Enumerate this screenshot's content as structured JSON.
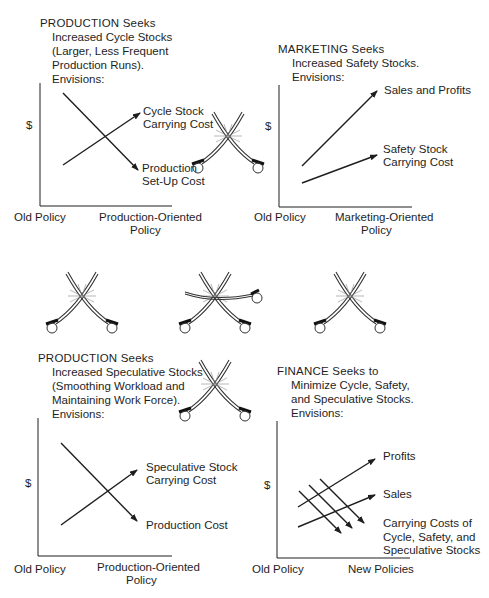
{
  "panels": {
    "production_cycle": {
      "heading": "PRODUCTION Seeks",
      "lines": [
        "Increased Cycle Stocks",
        "(Larger, Less Frequent",
        "Production Runs).",
        "Envisions:"
      ],
      "y_label": "$",
      "x_left": "Old Policy",
      "x_right_1": "Production-Oriented",
      "x_right_2": "Policy",
      "series": [
        {
          "name": "Cycle Stock Carrying Cost",
          "label_1": "Cycle Stock",
          "label_2": "Carrying Cost",
          "trend": "increasing"
        },
        {
          "name": "Production Set-Up Cost",
          "label_1": "Production",
          "label_2": "Set-Up Cost",
          "trend": "decreasing"
        }
      ]
    },
    "marketing": {
      "heading": "MARKETING Seeks",
      "lines": [
        "Increased Safety Stocks.",
        "Envisions:"
      ],
      "y_label": "$",
      "x_left": "Old Policy",
      "x_right_1": "Marketing-Oriented",
      "x_right_2": "Policy",
      "series": [
        {
          "name": "Sales and Profits",
          "label_1": "Sales and Profits",
          "label_2": "",
          "trend": "increasing-steep"
        },
        {
          "name": "Safety Stock Carrying Cost",
          "label_1": "Safety Stock",
          "label_2": "Carrying Cost",
          "trend": "increasing"
        }
      ]
    },
    "production_speculative": {
      "heading": "PRODUCTION Seeks",
      "lines": [
        "Increased Speculative Stocks",
        "(Smoothing Workload and",
        "Maintaining Work Force).",
        "Envisions:"
      ],
      "y_label": "$",
      "x_left": "Old Policy",
      "x_right_1": "Production-Oriented",
      "x_right_2": "Policy",
      "series": [
        {
          "name": "Speculative Stock Carrying Cost",
          "label_1": "Speculative  Stock",
          "label_2": "Carrying Cost",
          "trend": "increasing"
        },
        {
          "name": "Production Cost",
          "label_1": "Production Cost",
          "label_2": "",
          "trend": "decreasing"
        }
      ]
    },
    "finance": {
      "heading": "FINANCE Seeks to",
      "lines": [
        "Minimize Cycle, Safety,",
        "and Speculative Stocks.",
        "Envisions:"
      ],
      "y_label": "$",
      "x_left": "Old Policy",
      "x_right_1": "New Policies",
      "series": [
        {
          "name": "Profits",
          "label_1": "Profits",
          "trend": "increasing"
        },
        {
          "name": "Sales",
          "label_1": "Sales",
          "trend": "increasing"
        },
        {
          "name": "Carrying Costs of Cycle, Safety, and Speculative Stocks",
          "label_1": "Carrying Costs of",
          "label_2": "Cycle, Safety, and",
          "label_3": "Speculative Stocks",
          "trend": "decreasing",
          "count": 3
        }
      ]
    }
  },
  "illustrations": [
    "crossed-sabers",
    "crossed-sabers",
    "crossed-sabers",
    "three-sabers",
    "crossed-sabers",
    "crossed-sabers"
  ]
}
